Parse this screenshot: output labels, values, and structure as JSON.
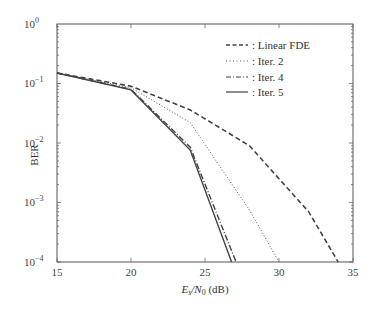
{
  "chart_data": {
    "type": "line",
    "title": "",
    "xlabel": "E_s/N_0 (dB)",
    "ylabel": "BER",
    "xlim": [
      15,
      35
    ],
    "ylim": [
      0.0001,
      1
    ],
    "yscale": "log",
    "grid": false,
    "legend_position": "upper right",
    "x_ticks": [
      "15",
      "20",
      "25",
      "30",
      "35"
    ],
    "y_ticks": [
      "10^0",
      "10^-1",
      "10^-2",
      "10^-3",
      "10^-4"
    ],
    "series": [
      {
        "name": "Linear FDE",
        "style": "dashed",
        "x": [
          15,
          20,
          24,
          28,
          32,
          34
        ],
        "values": [
          0.15,
          0.09,
          0.036,
          0.009,
          0.0007,
          0.0001
        ]
      },
      {
        "name": "Iter. 2",
        "style": "dotted",
        "x": [
          15,
          20,
          24,
          28,
          30
        ],
        "values": [
          0.15,
          0.085,
          0.022,
          0.00075,
          0.0001
        ]
      },
      {
        "name": "Iter. 4",
        "style": "dashdot",
        "x": [
          15,
          20,
          24,
          27.1
        ],
        "values": [
          0.15,
          0.08,
          0.0085,
          0.0001
        ]
      },
      {
        "name": "Iter. 5",
        "style": "solid",
        "x": [
          15,
          20,
          24,
          26.8
        ],
        "values": [
          0.15,
          0.078,
          0.0076,
          0.0001
        ]
      }
    ]
  },
  "labels": {
    "ylabel": "BER",
    "xlabel_main": "E",
    "xlabel_sub1": "s",
    "xlabel_slash": "/N",
    "xlabel_sub2": "0",
    "xlabel_unit": " (dB)",
    "legend": [
      ": Linear FDE",
      ": Iter. 2",
      ": Iter. 4",
      ": Iter. 5"
    ],
    "xticks": [
      "15",
      "20",
      "25",
      "30",
      "35"
    ],
    "yticks_base": "10",
    "yticks_exp": [
      "0",
      "−1",
      "−2",
      "−3",
      "−4"
    ]
  },
  "colors": {
    "line": "#444444",
    "axis": "#555555"
  }
}
